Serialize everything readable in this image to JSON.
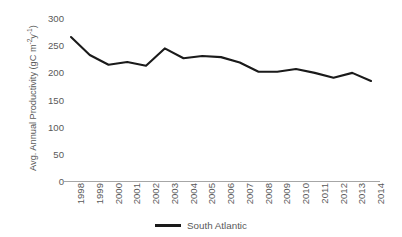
{
  "chart_data": {
    "type": "line",
    "title": "",
    "xlabel": "",
    "ylabel": "Avg. Annual Productivity (gC m⁻²y⁻¹)",
    "ylabel_prefix": "Avg. Annual Productivity (gC m",
    "ylabel_sup1": "-2",
    "ylabel_mid": "y",
    "ylabel_sup2": "-1",
    "ylabel_suffix": ")",
    "categories": [
      "1998",
      "1999",
      "2000",
      "2001",
      "2002",
      "2003",
      "2004",
      "2005",
      "2006",
      "2007",
      "2008",
      "2009",
      "2010",
      "2011",
      "2012",
      "2013",
      "2014"
    ],
    "series": [
      {
        "name": "South Atlantic",
        "color": "#1a1a1a",
        "values": [
          265,
          232,
          214,
          219,
          212,
          244,
          226,
          230,
          228,
          218,
          201,
          201,
          206,
          199,
          190,
          199,
          184
        ]
      }
    ],
    "ylim": [
      0,
      300
    ],
    "yticks": [
      0,
      50,
      100,
      150,
      200,
      250,
      300
    ],
    "ytick_labels": [
      "0",
      "50",
      "100",
      "150",
      "200",
      "250",
      "300"
    ],
    "grid": false,
    "legend_position": "bottom",
    "axis_color": "#a6a6a6",
    "text_color": "#595959"
  },
  "legend": {
    "entries": [
      {
        "label": "South Atlantic",
        "color": "#1a1a1a"
      }
    ]
  }
}
